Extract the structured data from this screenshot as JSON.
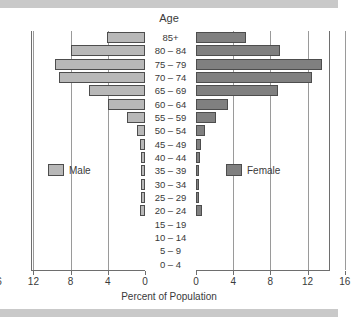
{
  "chart_data": {
    "type": "bar",
    "subtype": "population-pyramid",
    "title": "Age",
    "xlabel": "Percent of Population",
    "ylabel": "Age",
    "categories": [
      "0 – 4",
      "5 – 9",
      "10 – 14",
      "15 – 19",
      "20 – 24",
      "25 – 29",
      "30 – 34",
      "35 – 39",
      "40 – 44",
      "45 – 49",
      "50 – 54",
      "55 – 59",
      "60 – 64",
      "65 – 69",
      "70 – 74",
      "75 – 79",
      "80 – 84",
      "85+"
    ],
    "series": [
      {
        "name": "Male",
        "color": "#b8b8b8",
        "values": [
          0,
          0,
          0,
          0,
          0.5,
          0.4,
          0.4,
          0.4,
          0.4,
          0.5,
          0.9,
          1.9,
          4.0,
          6.0,
          9.2,
          9.7,
          8.0,
          4.1
        ]
      },
      {
        "name": "Female",
        "color": "#808080",
        "values": [
          0,
          0,
          0,
          0,
          0.6,
          0.3,
          0.3,
          0.3,
          0.4,
          0.5,
          1.0,
          2.1,
          3.4,
          8.8,
          12.5,
          13.5,
          9.0,
          5.4
        ]
      }
    ],
    "xticks": [
      16,
      12,
      8,
      4,
      0,
      0,
      4,
      8,
      12,
      16
    ],
    "xlim": [
      16,
      16
    ],
    "grid": true,
    "legend_position": "inside-middle",
    "axis_direction": "mirrored"
  },
  "legend": {
    "male_label": "Male",
    "female_label": "Female"
  },
  "colors": {
    "male": "#b8b8b8",
    "female": "#808080",
    "grid": "#9a9a9a",
    "frame": "#6e6e6e",
    "text": "#3a3a3a",
    "page_margin": "#c9c9c9"
  }
}
